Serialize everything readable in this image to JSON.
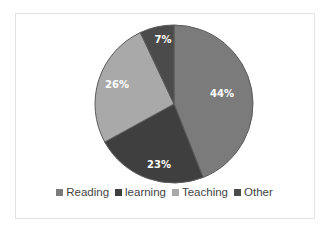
{
  "chart_data": {
    "type": "pie",
    "title": "",
    "categories": [
      "Reading",
      "learning",
      "Teaching",
      "Other"
    ],
    "values": [
      44,
      23,
      26,
      7
    ],
    "unit": "%",
    "data_labels": [
      "44%",
      "23%",
      "26%",
      "7%"
    ],
    "colors": [
      "#7b7b7b",
      "#3f3f3f",
      "#a9a9a9",
      "#4b4b4b"
    ],
    "start_angle": "12 o'clock",
    "direction": "clockwise",
    "legend_position": "bottom"
  },
  "legend": {
    "items": [
      {
        "label": "Reading",
        "color": "#7b7b7b"
      },
      {
        "label": "learning",
        "color": "#3f3f3f"
      },
      {
        "label": "Teaching",
        "color": "#a9a9a9"
      },
      {
        "label": "Other",
        "color": "#4b4b4b"
      }
    ]
  },
  "labels": {
    "reading": "44%",
    "learning": "23%",
    "teaching": "26%",
    "other": "7%"
  }
}
